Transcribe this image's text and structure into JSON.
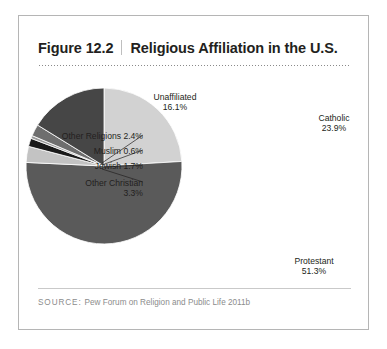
{
  "figure": {
    "number": "Figure 12.2",
    "title": "Religious Affiliation in the U.S.",
    "source_label": "SOURCE:",
    "source_text": "Pew Forum on Religion and Public Life 2011b"
  },
  "labels": {
    "unaffiliated": "Unaffiliated\n16.1%",
    "catholic": "Catholic\n23.9%",
    "protestant": "Protestant\n51.3%",
    "other_religions": "Other Religions 2.4%",
    "muslim": "Muslim 0.6%",
    "jewish": "Jewish 1.7%",
    "other_christian": "Other Christian\n3.3%"
  },
  "chart_data": {
    "type": "pie",
    "title": "Religious Affiliation in the U.S.",
    "subtitle": "",
    "xlabel": "",
    "ylabel": "",
    "units": "percent",
    "total": 99.3,
    "start_angle_deg": 0,
    "direction": "clockwise",
    "legend": "none",
    "labels_position": "outside-with-leader-lines",
    "categories": [
      "Catholic",
      "Protestant",
      "Other Christian",
      "Jewish",
      "Muslim",
      "Other Religions",
      "Unaffiliated"
    ],
    "values": [
      23.9,
      51.3,
      3.3,
      1.7,
      0.6,
      2.4,
      16.1
    ],
    "value_labels": [
      "23.9%",
      "51.3%",
      "3.3%",
      "1.7%",
      "0.6%",
      "2.4%",
      "16.1%"
    ],
    "colors": [
      "#d2d2d2",
      "#5a5a5a",
      "#c3c3c3",
      "#1a1a1a",
      "#9a9a9a",
      "#6e6e6e",
      "#464646"
    ],
    "slices": [
      {
        "name": "Catholic",
        "value": 23.9,
        "label": "Catholic 23.9%",
        "color": "#d2d2d2"
      },
      {
        "name": "Protestant",
        "value": 51.3,
        "label": "Protestant 51.3%",
        "color": "#5a5a5a"
      },
      {
        "name": "Other Christian",
        "value": 3.3,
        "label": "Other Christian 3.3%",
        "color": "#c3c3c3"
      },
      {
        "name": "Jewish",
        "value": 1.7,
        "label": "Jewish 1.7%",
        "color": "#1a1a1a"
      },
      {
        "name": "Muslim",
        "value": 0.6,
        "label": "Muslim 0.6%",
        "color": "#9a9a9a"
      },
      {
        "name": "Other Religions",
        "value": 2.4,
        "label": "Other Religions 2.4%",
        "color": "#6e6e6e"
      },
      {
        "name": "Unaffiliated",
        "value": 16.1,
        "label": "Unaffiliated 16.1%",
        "color": "#464646"
      }
    ]
  },
  "style": {
    "border_color": "#b5b5b5",
    "text_color": "#231f20",
    "source_color": "#8c8c8c",
    "rule_color": "#c9c9c9"
  }
}
